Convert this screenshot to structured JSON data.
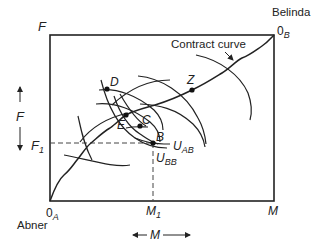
{
  "diagram": {
    "type": "edgeworth-box",
    "box": {
      "x0": 50,
      "y0": 35,
      "x1": 274,
      "y1": 201
    },
    "colors": {
      "line": "#222222",
      "dashed": "#444444",
      "background": "#ffffff"
    },
    "agents": {
      "bottom_left": {
        "name": "Abner",
        "origin": "0",
        "origin_sub": "A"
      },
      "top_right": {
        "name": "Belinda",
        "origin": "0",
        "origin_sub": "B"
      }
    },
    "axes": {
      "vertical_label": "F",
      "vertical_arrow_label": "F",
      "horizontal_label": "M",
      "horizontal_arrow_label": "M",
      "f1_label": "F",
      "f1_sub": "1",
      "m1_label": "M",
      "m1_sub": "1"
    },
    "curve_label": "Contract curve",
    "points": [
      {
        "id": "D",
        "label": "D",
        "x": 107,
        "y": 89
      },
      {
        "id": "E",
        "label": "E",
        "x": 126,
        "y": 115
      },
      {
        "id": "C",
        "label": "C",
        "x": 140,
        "y": 126
      },
      {
        "id": "B",
        "label": "B",
        "x": 153,
        "y": 143
      },
      {
        "id": "Z",
        "label": "Z",
        "x": 192,
        "y": 90
      }
    ],
    "utility_labels": [
      {
        "text": "U",
        "sub": "AB"
      },
      {
        "text": "U",
        "sub": "BB"
      }
    ]
  }
}
